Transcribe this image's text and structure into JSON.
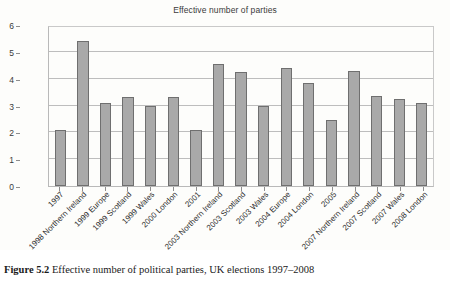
{
  "figure": {
    "caption_label": "Figure 5.2",
    "caption_text": "Effective number of political parties, UK elections 1997–2008"
  },
  "chart_data": {
    "type": "bar",
    "title": "Effective number of parties",
    "xlabel": "",
    "ylabel": "",
    "ylim": [
      0,
      6
    ],
    "yticks": [
      0,
      1,
      2,
      3,
      4,
      5,
      6
    ],
    "grid": true,
    "legend": "none",
    "bar_color": "#a9a9a9",
    "bar_border_color": "#6f6f6f",
    "categories": [
      "1997",
      "1998 Northern Ireland",
      "1999 Europe",
      "1999 Scotland",
      "1999 Wales",
      "2000 London",
      "2001",
      "2003 Northern Ireland",
      "2003 Scotland",
      "2003 Wales",
      "2004 Europe",
      "2004 London",
      "2005",
      "2007 Northern Ireland",
      "2007 Scotland",
      "2007 Wales",
      "2008 London"
    ],
    "values": [
      2.1,
      5.4,
      3.1,
      3.3,
      3.0,
      3.3,
      2.1,
      4.55,
      4.25,
      3.0,
      4.4,
      3.85,
      2.45,
      4.3,
      3.35,
      3.25,
      3.1
    ]
  }
}
